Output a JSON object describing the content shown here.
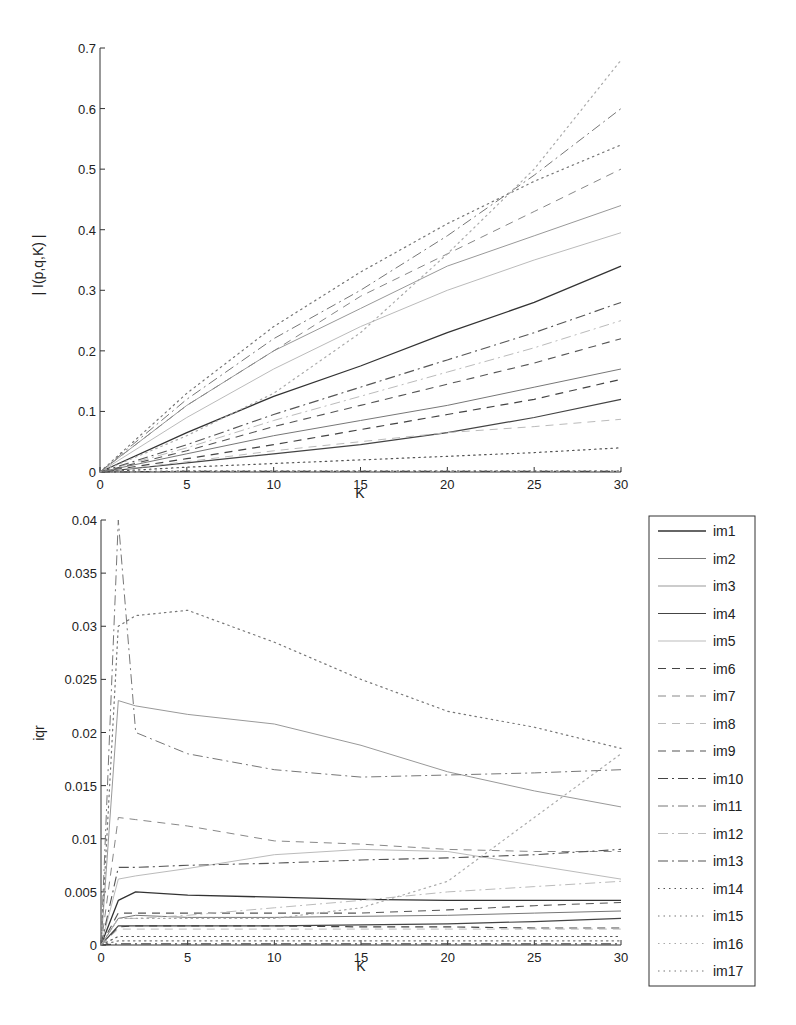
{
  "chart_data": [
    {
      "type": "line",
      "title": "",
      "xlabel": "K",
      "ylabel": "| I(p,q,K) |",
      "xlim": [
        0,
        30
      ],
      "ylim": [
        0,
        0.7
      ],
      "xticks": [
        "0",
        "5",
        "10",
        "15",
        "20",
        "25",
        "30"
      ],
      "yticks": [
        "0",
        "0.1",
        "0.2",
        "0.3",
        "0.4",
        "0.5",
        "0.6",
        "0.7"
      ],
      "grid": false,
      "x": [
        0,
        5,
        10,
        15,
        20,
        25,
        30
      ],
      "series": [
        {
          "name": "im1",
          "values": [
            0,
            0.065,
            0.125,
            0.175,
            0.23,
            0.28,
            0.34
          ]
        },
        {
          "name": "im2",
          "values": [
            0,
            0.03,
            0.06,
            0.085,
            0.11,
            0.14,
            0.17
          ]
        },
        {
          "name": "im3",
          "values": [
            0,
            0.11,
            0.2,
            0.27,
            0.34,
            0.39,
            0.44
          ]
        },
        {
          "name": "im4",
          "values": [
            0,
            0.015,
            0.03,
            0.045,
            0.065,
            0.09,
            0.12
          ]
        },
        {
          "name": "im5",
          "values": [
            0,
            0.09,
            0.17,
            0.24,
            0.3,
            0.35,
            0.395
          ]
        },
        {
          "name": "im6",
          "values": [
            0,
            0.022,
            0.045,
            0.07,
            0.095,
            0.12,
            0.153
          ]
        },
        {
          "name": "im7",
          "values": [
            0,
            0.11,
            0.2,
            0.29,
            0.36,
            0.43,
            0.5
          ]
        },
        {
          "name": "im8",
          "values": [
            0,
            0.017,
            0.035,
            0.05,
            0.065,
            0.075,
            0.087
          ]
        },
        {
          "name": "im9",
          "values": [
            0,
            0.035,
            0.075,
            0.11,
            0.145,
            0.18,
            0.22
          ]
        },
        {
          "name": "im10",
          "values": [
            0,
            0.001,
            0.001,
            0.001,
            0.001,
            0.001,
            0.001
          ]
        },
        {
          "name": "im11",
          "values": [
            0,
            0.12,
            0.22,
            0.3,
            0.39,
            0.49,
            0.6
          ]
        },
        {
          "name": "im12",
          "values": [
            0,
            0.04,
            0.085,
            0.125,
            0.165,
            0.205,
            0.25
          ]
        },
        {
          "name": "im13",
          "values": [
            0,
            0.045,
            0.095,
            0.14,
            0.185,
            0.23,
            0.28
          ]
        },
        {
          "name": "im14",
          "values": [
            0,
            0.008,
            0.014,
            0.02,
            0.026,
            0.032,
            0.04
          ]
        },
        {
          "name": "im15",
          "values": [
            0,
            0.13,
            0.24,
            0.33,
            0.41,
            0.48,
            0.54
          ]
        },
        {
          "name": "im16",
          "values": [
            0,
            0.06,
            0.13,
            0.23,
            0.36,
            0.5,
            0.68
          ]
        },
        {
          "name": "im17",
          "values": [
            0,
            0.002,
            0.002,
            0.002,
            0.002,
            0.002,
            0.002
          ]
        }
      ]
    },
    {
      "type": "line",
      "title": "",
      "xlabel": "K",
      "ylabel": "iqr",
      "xlim": [
        0,
        30
      ],
      "ylim": [
        0,
        0.04
      ],
      "xticks": [
        "0",
        "5",
        "10",
        "15",
        "20",
        "25",
        "30"
      ],
      "yticks": [
        "0",
        "0.005",
        "0.01",
        "0.015",
        "0.02",
        "0.025",
        "0.03",
        "0.035",
        "0.04"
      ],
      "grid": false,
      "legend_position": "outside right",
      "x": [
        0,
        1,
        2,
        5,
        10,
        15,
        20,
        25,
        30
      ],
      "series": [
        {
          "name": "im1",
          "values": [
            0,
            0.0042,
            0.005,
            0.0047,
            0.0045,
            0.0043,
            0.0042,
            0.0042,
            0.0042
          ]
        },
        {
          "name": "im2",
          "values": [
            0,
            0.0025,
            0.0028,
            0.0026,
            0.0026,
            0.0027,
            0.0028,
            0.003,
            0.0032
          ]
        },
        {
          "name": "im3",
          "values": [
            0,
            0.023,
            0.0225,
            0.0217,
            0.0208,
            0.0188,
            0.0163,
            0.0145,
            0.013
          ]
        },
        {
          "name": "im4",
          "values": [
            0,
            0.0018,
            0.0018,
            0.0018,
            0.0018,
            0.0019,
            0.002,
            0.0022,
            0.0025
          ]
        },
        {
          "name": "im5",
          "values": [
            0,
            0.0062,
            0.0065,
            0.0072,
            0.0085,
            0.009,
            0.0088,
            0.0075,
            0.0062
          ]
        },
        {
          "name": "im6",
          "values": [
            0,
            0.0017,
            0.0018,
            0.0018,
            0.0018,
            0.0017,
            0.0017,
            0.0016,
            0.0016
          ]
        },
        {
          "name": "im7",
          "values": [
            0,
            0.012,
            0.0118,
            0.0112,
            0.0098,
            0.0095,
            0.009,
            0.0088,
            0.0088
          ]
        },
        {
          "name": "im8",
          "values": [
            0,
            0.0015,
            0.0015,
            0.0015,
            0.0015,
            0.0015,
            0.0015,
            0.0015,
            0.0015
          ]
        },
        {
          "name": "im9",
          "values": [
            0,
            0.003,
            0.003,
            0.003,
            0.003,
            0.003,
            0.0033,
            0.0037,
            0.004
          ]
        },
        {
          "name": "im10",
          "values": [
            0,
            0.0001,
            0.0001,
            0.0001,
            0.0001,
            0.0001,
            0.0001,
            0.0001,
            0.0001
          ]
        },
        {
          "name": "im11",
          "values": [
            0,
            0.04,
            0.02,
            0.018,
            0.0165,
            0.0158,
            0.016,
            0.0162,
            0.0165
          ]
        },
        {
          "name": "im12",
          "values": [
            0,
            0.0025,
            0.0025,
            0.0028,
            0.0035,
            0.0042,
            0.005,
            0.0055,
            0.006
          ]
        },
        {
          "name": "im13",
          "values": [
            0,
            0.0073,
            0.0073,
            0.0075,
            0.0077,
            0.008,
            0.0082,
            0.0085,
            0.009
          ]
        },
        {
          "name": "im14",
          "values": [
            0,
            0.0008,
            0.0008,
            0.0008,
            0.0008,
            0.0008,
            0.0008,
            0.0008,
            0.0008
          ]
        },
        {
          "name": "im15",
          "values": [
            0,
            0.03,
            0.031,
            0.0315,
            0.0285,
            0.025,
            0.022,
            0.0205,
            0.0185
          ]
        },
        {
          "name": "im16",
          "values": [
            0,
            0.0025,
            0.0025,
            0.0025,
            0.0025,
            0.0035,
            0.006,
            0.012,
            0.018
          ]
        },
        {
          "name": "im17",
          "values": [
            0,
            0.0004,
            0.0004,
            0.0004,
            0.0004,
            0.0004,
            0.0004,
            0.0004,
            0.0004
          ]
        }
      ]
    }
  ],
  "styles": {
    "im1": {
      "color": "#333333",
      "dash": "",
      "width": 1.3
    },
    "im2": {
      "color": "#777777",
      "dash": "",
      "width": 1.0
    },
    "im3": {
      "color": "#999999",
      "dash": "",
      "width": 1.0
    },
    "im4": {
      "color": "#444444",
      "dash": "",
      "width": 1.2
    },
    "im5": {
      "color": "#bbbbbb",
      "dash": "",
      "width": 1.0
    },
    "im6": {
      "color": "#444444",
      "dash": "8,6",
      "width": 1.2
    },
    "im7": {
      "color": "#888888",
      "dash": "8,6",
      "width": 1.0
    },
    "im8": {
      "color": "#bbbbbb",
      "dash": "8,6",
      "width": 1.0
    },
    "im9": {
      "color": "#555555",
      "dash": "8,6",
      "width": 1.1
    },
    "im10": {
      "color": "#444444",
      "dash": "10,4,2,4",
      "width": 1.2
    },
    "im11": {
      "color": "#777777",
      "dash": "10,4,2,4",
      "width": 1.0
    },
    "im12": {
      "color": "#bbbbbb",
      "dash": "10,4,2,4",
      "width": 1.0
    },
    "im13": {
      "color": "#555555",
      "dash": "10,4,2,4",
      "width": 1.1
    },
    "im14": {
      "color": "#555555",
      "dash": "1.5,4",
      "width": 1.2
    },
    "im15": {
      "color": "#777777",
      "dash": "1.5,4",
      "width": 1.2
    },
    "im16": {
      "color": "#aaaaaa",
      "dash": "1.5,4",
      "width": 1.2
    },
    "im17": {
      "color": "#777777",
      "dash": "1.5,4",
      "width": 1.2
    }
  },
  "legend": {
    "items": [
      "im1",
      "im2",
      "im3",
      "im4",
      "im5",
      "im6",
      "im7",
      "im8",
      "im9",
      "im10",
      "im11",
      "im12",
      "im13",
      "im14",
      "im15",
      "im16",
      "im17"
    ]
  }
}
